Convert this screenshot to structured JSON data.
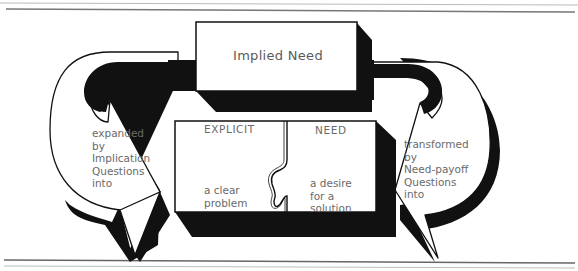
{
  "diagram": {
    "implied_box": {
      "label": "Implied Need"
    },
    "explicit_box": {
      "left_heading": "EXPLICIT",
      "right_heading": "NEED",
      "left_text": "a clear\nproblem",
      "right_text": "a desire\nfor a\nsolution"
    },
    "left_arrow": {
      "label": "expanded\nby\nImplication\nQuestions\ninto"
    },
    "right_arrow": {
      "label": "transformed\nby\nNeed-payoff\nQuestions\ninto"
    }
  },
  "colors": {
    "ink": "#111111",
    "text": "#6a6a6a",
    "rule": "#777777",
    "paper": "#ffffff"
  }
}
